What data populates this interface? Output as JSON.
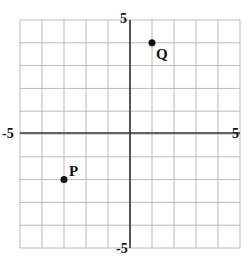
{
  "chart_data": {
    "type": "scatter",
    "title": "",
    "xlabel": "",
    "ylabel": "",
    "xlim": [
      -5,
      5
    ],
    "ylim": [
      -5,
      5
    ],
    "grid": true,
    "grid_step": 1,
    "axis_labels": {
      "x_min": "-5",
      "x_max": "5",
      "y_min": "-5",
      "y_max": "5"
    },
    "points": [
      {
        "label": "Q",
        "x": 1,
        "y": 4
      },
      {
        "label": "P",
        "x": -3,
        "y": -2
      }
    ]
  }
}
